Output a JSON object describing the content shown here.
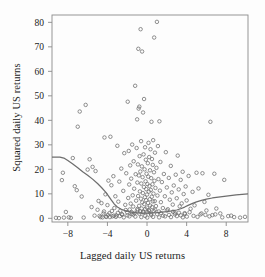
{
  "chart_data": {
    "type": "scatter",
    "title": "",
    "xlabel": "Lagged daily US returns",
    "ylabel": "Squared daily US returns",
    "xlim": [
      -9.6,
      10.2
    ],
    "ylim": [
      -1.5,
      83
    ],
    "xticks": [
      -8,
      -4,
      0,
      4,
      8
    ],
    "xtick_labels": [
      "−8",
      "−4",
      "0",
      "4",
      "8"
    ],
    "yticks": [
      0,
      10,
      20,
      30,
      40,
      50,
      60,
      70,
      80
    ],
    "ytick_labels": [
      "0",
      "10",
      "20",
      "30",
      "40",
      "50",
      "60",
      "70",
      "80"
    ],
    "grid": false,
    "legend": "none",
    "marker": "open-circle",
    "marker_color": "#6b6b6b",
    "frame_color": "#8a8a8a",
    "series": [
      {
        "name": "Squared vs lagged daily US returns",
        "points": [
          [
            -9.2,
            0.2
          ],
          [
            -8.9,
            0.1
          ],
          [
            -8.6,
            15.6
          ],
          [
            -8.5,
            18.6
          ],
          [
            -8.4,
            0.3
          ],
          [
            -8.2,
            2.6
          ],
          [
            -7.9,
            0.4
          ],
          [
            -7.7,
            0.2
          ],
          [
            -7.5,
            24.6
          ],
          [
            -7.3,
            13.1
          ],
          [
            -7.1,
            11.5
          ],
          [
            -7.0,
            37.4
          ],
          [
            -6.8,
            43.6
          ],
          [
            -6.6,
            8.9
          ],
          [
            -6.4,
            0.3
          ],
          [
            -6.2,
            46.3
          ],
          [
            -6.0,
            19.9
          ],
          [
            -5.8,
            24.1
          ],
          [
            -5.6,
            4.6
          ],
          [
            -5.5,
            21.0
          ],
          [
            -5.3,
            1.1
          ],
          [
            -5.2,
            19.3
          ],
          [
            -5.0,
            3.5
          ],
          [
            -4.9,
            7.1
          ],
          [
            -4.7,
            0.5
          ],
          [
            -4.6,
            6.2
          ],
          [
            -4.4,
            2.0
          ],
          [
            -4.3,
            33.0
          ],
          [
            -4.2,
            9.8
          ],
          [
            -4.1,
            0.6
          ],
          [
            -4.0,
            5.4
          ],
          [
            -3.9,
            15.4
          ],
          [
            -3.8,
            2.1
          ],
          [
            -3.7,
            33.3
          ],
          [
            -3.6,
            13.5
          ],
          [
            -3.5,
            0.8
          ],
          [
            -3.4,
            17.2
          ],
          [
            -3.3,
            4.2
          ],
          [
            -3.2,
            9.0
          ],
          [
            -3.1,
            1.2
          ],
          [
            -3.0,
            29.6
          ],
          [
            -2.9,
            6.8
          ],
          [
            -2.8,
            15.0
          ],
          [
            -2.7,
            3.1
          ],
          [
            -2.6,
            20.3
          ],
          [
            -2.5,
            1.5
          ],
          [
            -2.4,
            11.2
          ],
          [
            -2.3,
            26.6
          ],
          [
            -2.2,
            5.5
          ],
          [
            -2.1,
            18.4
          ],
          [
            -2.0,
            2.4
          ],
          [
            -1.95,
            47.6
          ],
          [
            -1.9,
            8.3
          ],
          [
            -1.85,
            27.5
          ],
          [
            -1.8,
            13.8
          ],
          [
            -1.75,
            3.6
          ],
          [
            -1.7,
            21.6
          ],
          [
            -1.65,
            6.0
          ],
          [
            -1.6,
            16.2
          ],
          [
            -1.55,
            1.8
          ],
          [
            -1.5,
            30.1
          ],
          [
            -1.45,
            9.4
          ],
          [
            -1.4,
            4.8
          ],
          [
            -1.35,
            23.3
          ],
          [
            -1.3,
            12.1
          ],
          [
            -1.25,
            2.2
          ],
          [
            -1.2,
            54.1
          ],
          [
            -1.15,
            18.0
          ],
          [
            -1.1,
            7.2
          ],
          [
            -1.05,
            28.7
          ],
          [
            -1.0,
            40.4
          ],
          [
            -0.98,
            14.6
          ],
          [
            -0.95,
            3.3
          ],
          [
            -0.92,
            22.0
          ],
          [
            -0.9,
            9.1
          ],
          [
            -0.88,
            69.2
          ],
          [
            -0.85,
            44.8
          ],
          [
            -0.82,
            17.5
          ],
          [
            -0.8,
            5.1
          ],
          [
            -0.78,
            45.6
          ],
          [
            -0.75,
            25.4
          ],
          [
            -0.72,
            11.0
          ],
          [
            -0.7,
            2.9
          ],
          [
            -0.68,
            19.1
          ],
          [
            -0.65,
            77.2
          ],
          [
            -0.62,
            8.0
          ],
          [
            -0.6,
            31.5
          ],
          [
            -0.58,
            14.2
          ],
          [
            -0.55,
            4.0
          ],
          [
            -0.52,
            21.2
          ],
          [
            -0.5,
            68.1
          ],
          [
            -0.48,
            6.5
          ],
          [
            -0.45,
            16.8
          ],
          [
            -0.42,
            10.3
          ],
          [
            -0.4,
            43.2
          ],
          [
            -0.38,
            2.7
          ],
          [
            -0.35,
            26.1
          ],
          [
            -0.32,
            12.8
          ],
          [
            -0.3,
            48.7
          ],
          [
            -0.28,
            5.8
          ],
          [
            -0.25,
            20.0
          ],
          [
            -0.22,
            8.6
          ],
          [
            -0.2,
            29.0
          ],
          [
            -0.18,
            3.8
          ],
          [
            -0.15,
            15.1
          ],
          [
            -0.12,
            23.9
          ],
          [
            -0.1,
            7.4
          ],
          [
            -0.08,
            11.9
          ],
          [
            -0.05,
            18.2
          ],
          [
            -0.02,
            4.4
          ],
          [
            0.0,
            9.7
          ],
          [
            0.03,
            14.0
          ],
          [
            0.05,
            2.5
          ],
          [
            0.08,
            22.5
          ],
          [
            0.1,
            6.3
          ],
          [
            0.12,
            17.0
          ],
          [
            0.15,
            30.8
          ],
          [
            0.18,
            10.9
          ],
          [
            0.2,
            3.4
          ],
          [
            0.22,
            25.0
          ],
          [
            0.25,
            13.2
          ],
          [
            0.28,
            7.8
          ],
          [
            0.3,
            19.6
          ],
          [
            0.32,
            5.2
          ],
          [
            0.35,
            28.2
          ],
          [
            0.38,
            11.6
          ],
          [
            0.4,
            1.9
          ],
          [
            0.42,
            16.4
          ],
          [
            0.45,
            39.4
          ],
          [
            0.48,
            8.8
          ],
          [
            0.5,
            24.2
          ],
          [
            0.52,
            4.6
          ],
          [
            0.55,
            13.9
          ],
          [
            0.58,
            21.8
          ],
          [
            0.6,
            6.9
          ],
          [
            0.62,
            31.9
          ],
          [
            0.65,
            10.1
          ],
          [
            0.68,
            3.0
          ],
          [
            0.7,
            18.8
          ],
          [
            0.72,
            73.8
          ],
          [
            0.75,
            15.3
          ],
          [
            0.78,
            7.0
          ],
          [
            0.8,
            26.8
          ],
          [
            0.85,
            12.4
          ],
          [
            0.9,
            5.0
          ],
          [
            0.95,
            20.6
          ],
          [
            1.0,
            80.2
          ],
          [
            1.05,
            9.3
          ],
          [
            1.1,
            29.5
          ],
          [
            1.15,
            16.0
          ],
          [
            1.2,
            2.8
          ],
          [
            1.25,
            39.6
          ],
          [
            1.3,
            11.3
          ],
          [
            1.35,
            23.0
          ],
          [
            1.4,
            6.6
          ],
          [
            1.5,
            14.8
          ],
          [
            1.6,
            4.2
          ],
          [
            1.7,
            18.1
          ],
          [
            1.8,
            9.0
          ],
          [
            1.9,
            27.0
          ],
          [
            2.0,
            12.6
          ],
          [
            2.1,
            3.7
          ],
          [
            2.2,
            16.5
          ],
          [
            2.3,
            7.6
          ],
          [
            2.4,
            21.4
          ],
          [
            2.5,
            10.6
          ],
          [
            2.6,
            5.6
          ],
          [
            2.7,
            13.4
          ],
          [
            2.8,
            2.3
          ],
          [
            2.9,
            17.8
          ],
          [
            3.0,
            8.2
          ],
          [
            3.1,
            25.6
          ],
          [
            3.2,
            11.8
          ],
          [
            3.3,
            4.9
          ],
          [
            3.4,
            15.7
          ],
          [
            3.5,
            6.1
          ],
          [
            3.6,
            19.0
          ],
          [
            3.7,
            9.9
          ],
          [
            3.8,
            2.1
          ],
          [
            3.9,
            13.0
          ],
          [
            4.0,
            7.3
          ],
          [
            4.2,
            17.3
          ],
          [
            4.4,
            3.9
          ],
          [
            4.6,
            10.8
          ],
          [
            4.8,
            5.3
          ],
          [
            5.0,
            18.6
          ],
          [
            5.2,
            12.2
          ],
          [
            5.4,
            1.6
          ],
          [
            5.6,
            18.4
          ],
          [
            5.8,
            6.7
          ],
          [
            6.0,
            3.2
          ],
          [
            6.2,
            9.6
          ],
          [
            6.4,
            39.4
          ],
          [
            6.6,
            1.3
          ],
          [
            6.8,
            18.2
          ],
          [
            7.0,
            4.0
          ],
          [
            7.4,
            2.0
          ],
          [
            7.8,
            15.7
          ],
          [
            8.2,
            0.9
          ],
          [
            8.8,
            0.5
          ],
          [
            9.4,
            0.3
          ],
          [
            9.9,
            0.6
          ],
          [
            -4.8,
            1.0
          ],
          [
            -4.5,
            0.4
          ],
          [
            -4.35,
            2.8
          ],
          [
            -4.15,
            0.7
          ],
          [
            -3.95,
            1.4
          ],
          [
            -3.75,
            0.5
          ],
          [
            -3.55,
            3.0
          ],
          [
            -3.35,
            1.1
          ],
          [
            -3.15,
            0.6
          ],
          [
            -2.95,
            2.2
          ],
          [
            -2.75,
            0.9
          ],
          [
            -2.55,
            1.7
          ],
          [
            -2.35,
            0.4
          ],
          [
            -2.15,
            3.4
          ],
          [
            -1.98,
            1.2
          ],
          [
            -1.78,
            0.8
          ],
          [
            -1.58,
            2.6
          ],
          [
            -1.38,
            1.5
          ],
          [
            -1.18,
            0.7
          ],
          [
            -0.98,
            3.8
          ],
          [
            -0.78,
            1.9
          ],
          [
            -0.58,
            0.5
          ],
          [
            -0.38,
            2.4
          ],
          [
            -0.18,
            1.0
          ],
          [
            0.02,
            0.3
          ],
          [
            0.22,
            2.9
          ],
          [
            0.42,
            1.3
          ],
          [
            0.62,
            0.6
          ],
          [
            0.82,
            3.5
          ],
          [
            1.02,
            1.7
          ],
          [
            1.22,
            0.4
          ],
          [
            1.42,
            2.1
          ],
          [
            1.62,
            1.1
          ],
          [
            1.82,
            0.8
          ],
          [
            2.02,
            3.2
          ],
          [
            2.22,
            1.4
          ],
          [
            2.42,
            0.5
          ],
          [
            2.62,
            2.7
          ],
          [
            2.82,
            1.6
          ],
          [
            3.02,
            0.9
          ],
          [
            3.22,
            2.3
          ],
          [
            3.42,
            1.2
          ],
          [
            3.62,
            0.4
          ],
          [
            3.82,
            1.8
          ],
          [
            4.02,
            0.7
          ],
          [
            4.3,
            2.5
          ],
          [
            4.7,
            1.0
          ],
          [
            5.1,
            0.6
          ],
          [
            5.5,
            2.0
          ],
          [
            5.9,
            1.4
          ],
          [
            6.3,
            0.8
          ],
          [
            6.9,
            1.6
          ],
          [
            7.6,
            0.4
          ],
          [
            8.5,
            1.1
          ]
        ]
      }
    ],
    "fit_curve": {
      "name": "smoothed-fit",
      "color": "#6d6d6d",
      "points": [
        [
          -9.6,
          25.0
        ],
        [
          -8.8,
          25.0
        ],
        [
          -8.4,
          24.6
        ],
        [
          -8.0,
          23.6
        ],
        [
          -7.5,
          22.2
        ],
        [
          -7.0,
          20.6
        ],
        [
          -6.5,
          19.0
        ],
        [
          -6.0,
          17.6
        ],
        [
          -5.5,
          16.0
        ],
        [
          -5.0,
          14.2
        ],
        [
          -4.6,
          12.6
        ],
        [
          -4.2,
          10.8
        ],
        [
          -3.9,
          9.2
        ],
        [
          -3.6,
          7.4
        ],
        [
          -3.3,
          5.8
        ],
        [
          -3.0,
          4.6
        ],
        [
          -2.6,
          3.7
        ],
        [
          -2.2,
          3.1
        ],
        [
          -1.8,
          2.7
        ],
        [
          -1.4,
          2.4
        ],
        [
          -1.0,
          2.2
        ],
        [
          -0.5,
          2.1
        ],
        [
          0.0,
          2.1
        ],
        [
          0.5,
          2.2
        ],
        [
          1.0,
          2.3
        ],
        [
          1.5,
          2.5
        ],
        [
          2.0,
          2.7
        ],
        [
          2.5,
          3.0
        ],
        [
          3.0,
          3.4
        ],
        [
          3.4,
          3.9
        ],
        [
          3.8,
          4.6
        ],
        [
          4.2,
          5.4
        ],
        [
          4.6,
          6.1
        ],
        [
          5.0,
          6.7
        ],
        [
          5.5,
          7.3
        ],
        [
          6.0,
          7.8
        ],
        [
          6.6,
          8.3
        ],
        [
          7.2,
          8.7
        ],
        [
          7.8,
          9.0
        ],
        [
          8.4,
          9.3
        ],
        [
          9.0,
          9.6
        ],
        [
          9.6,
          9.8
        ],
        [
          10.2,
          10.0
        ]
      ]
    }
  }
}
